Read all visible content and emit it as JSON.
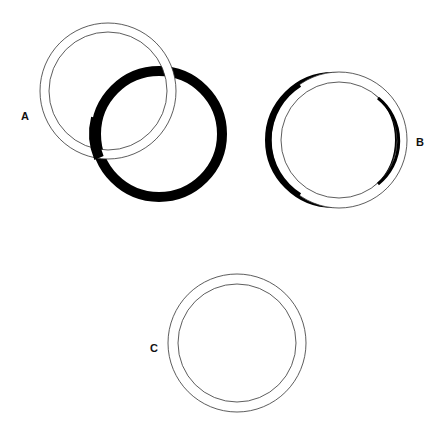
{
  "figures": [
    {
      "label": "A",
      "description": "white ring overlapping a black ring"
    },
    {
      "label": "B",
      "description": "white ring over slightly offset black ring"
    },
    {
      "label": "C",
      "description": "white ring alone"
    }
  ],
  "colors": {
    "ring_outline": "#333333",
    "black_ring": "#000000",
    "background": "#ffffff"
  }
}
